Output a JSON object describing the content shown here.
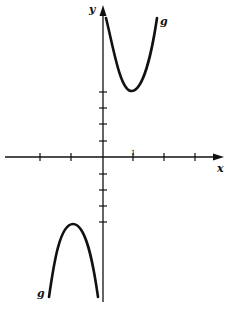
{
  "figure": {
    "x_axis_label": "x",
    "y_axis_label": "y",
    "tick_label_x1": "1",
    "curve_label_upper": "g",
    "curve_label_lower": "g",
    "colors": {
      "ink": "#111111",
      "background": "#ffffff"
    }
  },
  "diagram": {
    "type": "function-graph",
    "x_ticks": [
      -3,
      -2,
      -1,
      1,
      2,
      3
    ],
    "y_ticks": [
      -4,
      -3,
      -2,
      -1,
      1,
      2,
      3,
      4
    ],
    "branches": [
      {
        "name": "g",
        "region": "x>0, upper",
        "shape": "U-shaped, opening up",
        "local_min": [
          1,
          4
        ],
        "asymptote": "y-axis"
      },
      {
        "name": "g",
        "region": "x<0, lower",
        "shape": "inverted U, opening down",
        "local_max": [
          -1,
          -4
        ],
        "asymptote": "y-axis"
      }
    ]
  }
}
